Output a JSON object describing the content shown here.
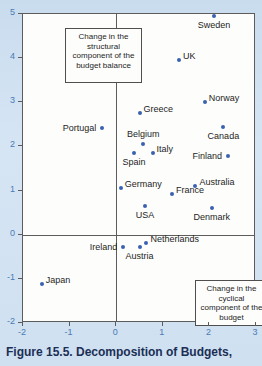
{
  "caption": "Figure 15.5.  Decomposition of Budgets,",
  "colors": {
    "marker": "#3a62b0",
    "tick_label": "#4a7ab5",
    "frame": "#5c5c5c",
    "plot_background": "#fdfdfc",
    "page_background": "#cfe0f0",
    "caption": "#1b2f55"
  },
  "annotations": {
    "structural": "Change in the structural component of the budget balance",
    "cyclical": "Change in the cyclical component of the budget"
  },
  "chart_data": {
    "type": "scatter",
    "title": "Figure 15.5.  Decomposition of Budgets,",
    "xlabel": "Change in the cyclical component of the budget",
    "ylabel": "Change in the structural component of the budget balance",
    "xlim": [
      -2,
      3
    ],
    "ylim": [
      -2,
      5
    ],
    "xticks": [
      -2,
      -1,
      0,
      1,
      2,
      3
    ],
    "yticks": [
      -2,
      -1,
      0,
      1,
      2,
      3,
      4,
      5
    ],
    "grid": false,
    "legend": "none",
    "points": [
      {
        "label": "Sweden",
        "x": 2.1,
        "y": 4.95,
        "label_pos": "below"
      },
      {
        "label": "UK",
        "x": 1.35,
        "y": 3.95,
        "label_pos": "right"
      },
      {
        "label": "Norway",
        "x": 1.9,
        "y": 3.0,
        "label_pos": "right"
      },
      {
        "label": "Greece",
        "x": 0.5,
        "y": 2.75,
        "label_pos": "right"
      },
      {
        "label": "Canada",
        "x": 2.3,
        "y": 2.45,
        "label_pos": "below"
      },
      {
        "label": "Portugal",
        "x": -0.3,
        "y": 2.42,
        "label_pos": "left"
      },
      {
        "label": "Belgium",
        "x": 0.58,
        "y": 2.05,
        "label_pos": "above"
      },
      {
        "label": "Italy",
        "x": 0.78,
        "y": 1.85,
        "label_pos": "right"
      },
      {
        "label": "Spain",
        "x": 0.38,
        "y": 1.85,
        "label_pos": "below"
      },
      {
        "label": "Finland",
        "x": 2.4,
        "y": 1.78,
        "label_pos": "left"
      },
      {
        "label": "Australia",
        "x": 1.7,
        "y": 1.1,
        "label_pos": "right"
      },
      {
        "label": "Germany",
        "x": 0.1,
        "y": 1.05,
        "label_pos": "right"
      },
      {
        "label": "France",
        "x": 1.2,
        "y": 0.93,
        "label_pos": "right"
      },
      {
        "label": "USA",
        "x": 0.62,
        "y": 0.65,
        "label_pos": "below"
      },
      {
        "label": "Denmark",
        "x": 2.05,
        "y": 0.6,
        "label_pos": "below"
      },
      {
        "label": "Netherlands",
        "x": 0.65,
        "y": -0.18,
        "label_pos": "right"
      },
      {
        "label": "Ireland",
        "x": 0.15,
        "y": -0.28,
        "label_pos": "left"
      },
      {
        "label": "Austria",
        "x": 0.5,
        "y": -0.28,
        "label_pos": "below"
      },
      {
        "label": "Japan",
        "x": -1.6,
        "y": -1.12,
        "label_pos": "right"
      }
    ]
  }
}
